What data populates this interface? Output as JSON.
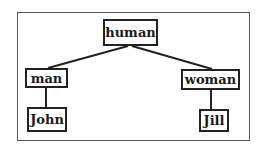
{
  "diagram": {
    "type": "tree",
    "nodes": [
      {
        "id": "human",
        "label": "human"
      },
      {
        "id": "man",
        "label": "man"
      },
      {
        "id": "woman",
        "label": "woman"
      },
      {
        "id": "john",
        "label": "John"
      },
      {
        "id": "jill",
        "label": "Jill"
      }
    ],
    "edges": [
      {
        "from": "human",
        "to": "man"
      },
      {
        "from": "human",
        "to": "woman"
      },
      {
        "from": "man",
        "to": "john"
      },
      {
        "from": "woman",
        "to": "jill"
      }
    ]
  },
  "colors": {
    "line": "#222222",
    "frame": "#555555",
    "background": "#ffffff"
  }
}
